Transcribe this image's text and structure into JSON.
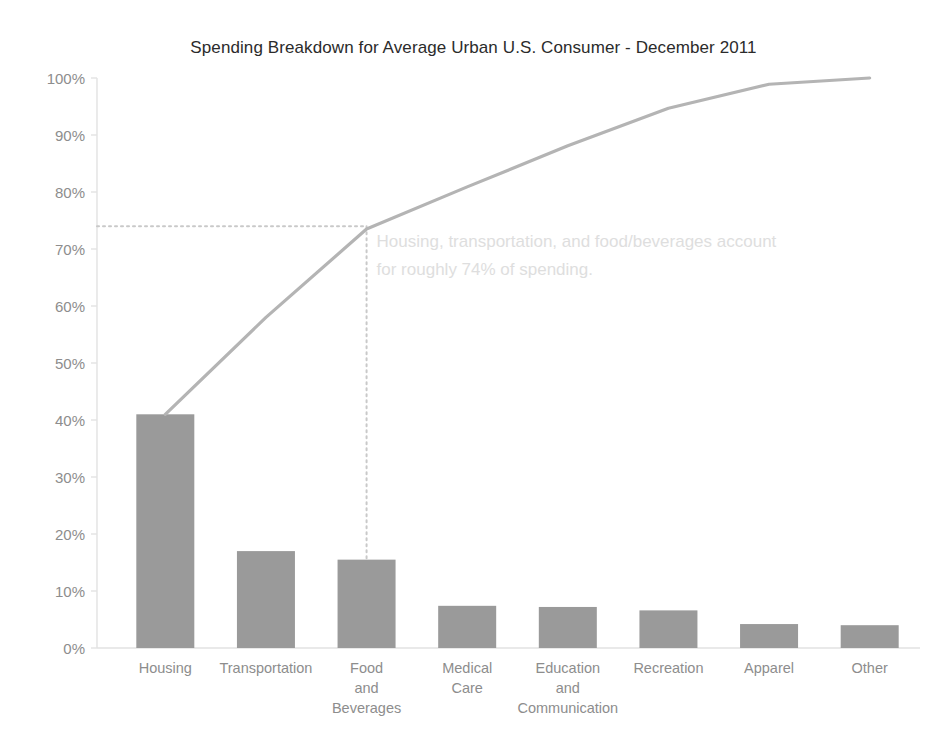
{
  "chart_data": {
    "type": "bar",
    "title": "Spending Breakdown for Average Urban U.S. Consumer - December 2011",
    "xlabel": "",
    "ylabel": "",
    "ylim": [
      0,
      100
    ],
    "grid": false,
    "legend": "none",
    "categories": [
      "Housing",
      "Transportation",
      "Food and Beverages",
      "Medical Care",
      "Education and Communication",
      "Recreation",
      "Apparel",
      "Other"
    ],
    "category_label_lines": [
      [
        "Housing"
      ],
      [
        "Transportation"
      ],
      [
        "Food",
        "and",
        "Beverages"
      ],
      [
        "Medical",
        "Care"
      ],
      [
        "Education",
        "and",
        "Communication"
      ],
      [
        "Recreation"
      ],
      [
        "Apparel"
      ],
      [
        "Other"
      ]
    ],
    "series": [
      {
        "name": "Share of spending",
        "type": "bar",
        "values": [
          41.0,
          17.0,
          15.5,
          7.4,
          7.2,
          6.6,
          4.2,
          4.0
        ]
      },
      {
        "name": "Cumulative share",
        "type": "line",
        "values": [
          41.0,
          58.0,
          73.5,
          80.9,
          88.1,
          94.7,
          98.9,
          100.0
        ]
      }
    ],
    "ytick_labels": [
      "100%",
      "90%",
      "80%",
      "70%",
      "60%",
      "50%",
      "40%",
      "30%",
      "20%",
      "10%",
      "0%"
    ],
    "ytick_values": [
      100,
      90,
      80,
      70,
      60,
      50,
      40,
      30,
      20,
      10,
      0
    ],
    "annotations": [
      {
        "name": "cumulative-callout",
        "line1": "Housing, transportation, and food/beverages account",
        "line2": "for roughly 74% of spending.",
        "reference_value": 74,
        "reference_category": "Food and Beverages"
      }
    ],
    "guide_lines": [
      {
        "name": "horizontal-74-percent",
        "orientation": "horizontal",
        "value": 74,
        "style": "dotted"
      },
      {
        "name": "vertical-food-beverages",
        "orientation": "vertical",
        "category": "Food and Beverages",
        "style": "dotted"
      }
    ]
  },
  "colors": {
    "bar_fill": "#9a9a9a",
    "cumulative_line": "#b4b4b4",
    "guide_line": "#c9c9c9",
    "axis_line": "#e2e2e2",
    "tick_text": "#8d8d8d",
    "title_text": "#2b2b2b",
    "annotation_text": "#dedede",
    "background": "#ffffff"
  }
}
